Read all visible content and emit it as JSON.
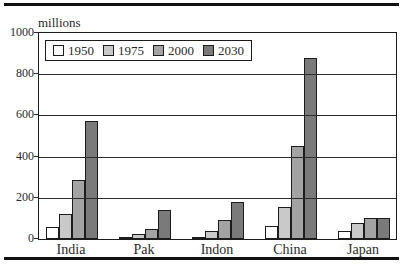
{
  "figure": {
    "unit_label": "millions"
  },
  "chart_data": {
    "type": "bar",
    "unit_label": "millions",
    "categories": [
      "India",
      "Pak",
      "Indon",
      "China",
      "Japan"
    ],
    "series": [
      {
        "name": "1950",
        "color": "#ffffff",
        "values": [
          60,
          10,
          10,
          65,
          40
        ]
      },
      {
        "name": "1975",
        "color": "#c9c9c9",
        "values": [
          120,
          25,
          40,
          155,
          80
        ]
      },
      {
        "name": "2000",
        "color": "#a3a3a3",
        "values": [
          285,
          50,
          90,
          450,
          100
        ]
      },
      {
        "name": "2030",
        "color": "#7a7a7a",
        "values": [
          575,
          140,
          180,
          880,
          100
        ]
      }
    ],
    "ylim": [
      0,
      1000
    ],
    "yticks": [
      0,
      200,
      400,
      600,
      800,
      1000
    ],
    "grid": "horizontal-over-bars",
    "legend_position": "top-left-inside",
    "bar_border_color": "#1c1c1c",
    "frame_color": "#1c1c1c"
  }
}
